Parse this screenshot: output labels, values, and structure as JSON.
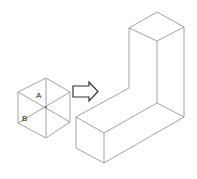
{
  "diagram": {
    "type": "isometric-transformation",
    "source_shape": {
      "name": "isometric-cube-hexagon",
      "labels": [
        {
          "text": "A",
          "x": 39,
          "y": 97
        },
        {
          "text": "B",
          "x": 25,
          "y": 120
        }
      ]
    },
    "arrow": {
      "direction": "right"
    },
    "result_shape": {
      "name": "l-shaped-prism"
    },
    "colors": {
      "edge": "#8a8a8a",
      "arrow_stroke": "#333333",
      "label": "#222222",
      "background": "#ffffff"
    }
  }
}
